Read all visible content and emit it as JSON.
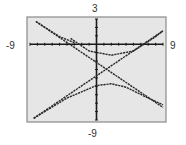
{
  "window": {
    "xmin": "-9",
    "xmax": "9",
    "ymin": "-9",
    "ymax": "3"
  },
  "colors": {
    "screen_bg": "#e6e6e6",
    "frame": "#8a8a8a",
    "axes": "#1a1a1a",
    "curves": "#2a2a2a"
  },
  "chart_data": {
    "type": "line",
    "title": "",
    "xlabel": "",
    "ylabel": "",
    "xlim": [
      -9,
      9
    ],
    "ylim": [
      -9,
      3
    ],
    "tick_labels": {
      "x_left": "-9",
      "x_right": "9",
      "y_top": "3",
      "y_bottom": "-9"
    },
    "grid": false,
    "legend": null,
    "series": [
      {
        "name": "asymptote-1 (decreasing)",
        "points": [
          [
            -8.2,
            2.7
          ],
          [
            9,
            -7.5
          ]
        ]
      },
      {
        "name": "asymptote-2 (increasing)",
        "points": [
          [
            -8.5,
            -8.8
          ],
          [
            9,
            1.6
          ]
        ]
      },
      {
        "name": "upper branch",
        "points": [
          [
            -3.5,
            0.7
          ],
          [
            -1,
            -0.8
          ],
          [
            2,
            -1.3
          ],
          [
            5,
            -0.8
          ],
          [
            8,
            0.9
          ],
          [
            9,
            1.6
          ]
        ]
      },
      {
        "name": "upper branch left",
        "points": [
          [
            -8.2,
            2.7
          ],
          [
            -5,
            0.9
          ],
          [
            -3,
            0.2
          ]
        ]
      },
      {
        "name": "lower branch",
        "points": [
          [
            -8.5,
            -8.8
          ],
          [
            -4,
            -6.4
          ],
          [
            0,
            -4.9
          ],
          [
            2,
            -4.7
          ],
          [
            4,
            -5.1
          ],
          [
            7,
            -6.4
          ],
          [
            9,
            -7.2
          ]
        ]
      }
    ]
  }
}
